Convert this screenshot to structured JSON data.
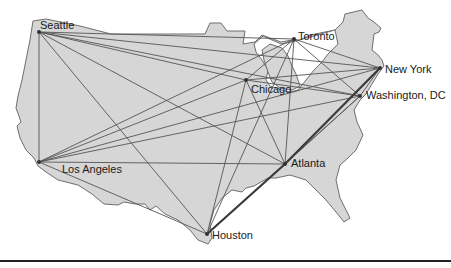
{
  "map": {
    "title": "",
    "colors": {
      "land": "#d6d6d6",
      "border": "#6e6e6e",
      "route": "#555555",
      "highlight_route": "#3a3a3a"
    },
    "cities": [
      {
        "id": "seattle",
        "label": "Seattle",
        "x": 39,
        "y": 32
      },
      {
        "id": "toronto",
        "label": "Toronto",
        "x": 294,
        "y": 39
      },
      {
        "id": "chicago",
        "label": "Chicago",
        "x": 246,
        "y": 80
      },
      {
        "id": "newyork",
        "label": "New York",
        "x": 380,
        "y": 68
      },
      {
        "id": "washington",
        "label": "Washington, DC",
        "x": 360,
        "y": 96
      },
      {
        "id": "losangeles",
        "label": "Los Angeles",
        "x": 39,
        "y": 162
      },
      {
        "id": "atlanta",
        "label": "Atlanta",
        "x": 285,
        "y": 164
      },
      {
        "id": "houston",
        "label": "Houston",
        "x": 207,
        "y": 234
      }
    ],
    "highlighted_route": [
      "Houston",
      "Atlanta",
      "New York"
    ]
  }
}
